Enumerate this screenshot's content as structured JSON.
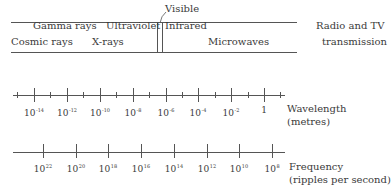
{
  "spectrum": {
    "visible_label": "Visible",
    "bands_top": [
      {
        "label": "Gamma rays",
        "x": 33,
        "y": 29
      },
      {
        "label": "Ultraviolet",
        "x": 106,
        "y": 29
      },
      {
        "label": "Infrared",
        "x": 165,
        "y": 29
      },
      {
        "label": "Radio and TV",
        "x": 316,
        "y": 29
      }
    ],
    "bands_bottom": [
      {
        "label": "Cosmic rays",
        "x": 11,
        "y": 45
      },
      {
        "label": "X-rays",
        "x": 92,
        "y": 45
      },
      {
        "label": "Microwaves",
        "x": 208,
        "y": 45
      },
      {
        "label": "transmission",
        "x": 322,
        "y": 45
      }
    ]
  },
  "wavelength": {
    "title": "Wavelength",
    "unit": "(metres)",
    "major_ticks": [
      {
        "base": "10",
        "exp": "-14",
        "x": 34
      },
      {
        "base": "10",
        "exp": "-12",
        "x": 67
      },
      {
        "base": "10",
        "exp": "-10",
        "x": 100
      },
      {
        "base": "10",
        "exp": "-8",
        "x": 133
      },
      {
        "base": "10",
        "exp": "-6",
        "x": 166
      },
      {
        "base": "10",
        "exp": "-4",
        "x": 198
      },
      {
        "base": "10",
        "exp": "-2",
        "x": 231
      },
      {
        "base": "1",
        "exp": "",
        "x": 264
      }
    ],
    "minor_ticks_x": [
      17,
      50,
      83,
      116,
      149,
      182,
      215,
      248,
      280
    ]
  },
  "frequency": {
    "title": "Frequency",
    "unit": "(ripples per second)",
    "major_ticks": [
      {
        "base": "10",
        "exp": "22",
        "x": 43
      },
      {
        "base": "10",
        "exp": "20",
        "x": 76
      },
      {
        "base": "10",
        "exp": "18",
        "x": 108
      },
      {
        "base": "10",
        "exp": "16",
        "x": 141
      },
      {
        "base": "10",
        "exp": "14",
        "x": 174
      },
      {
        "base": "10",
        "exp": "12",
        "x": 207
      },
      {
        "base": "10",
        "exp": "10",
        "x": 239
      },
      {
        "base": "10",
        "exp": "8",
        "x": 272
      }
    ]
  }
}
